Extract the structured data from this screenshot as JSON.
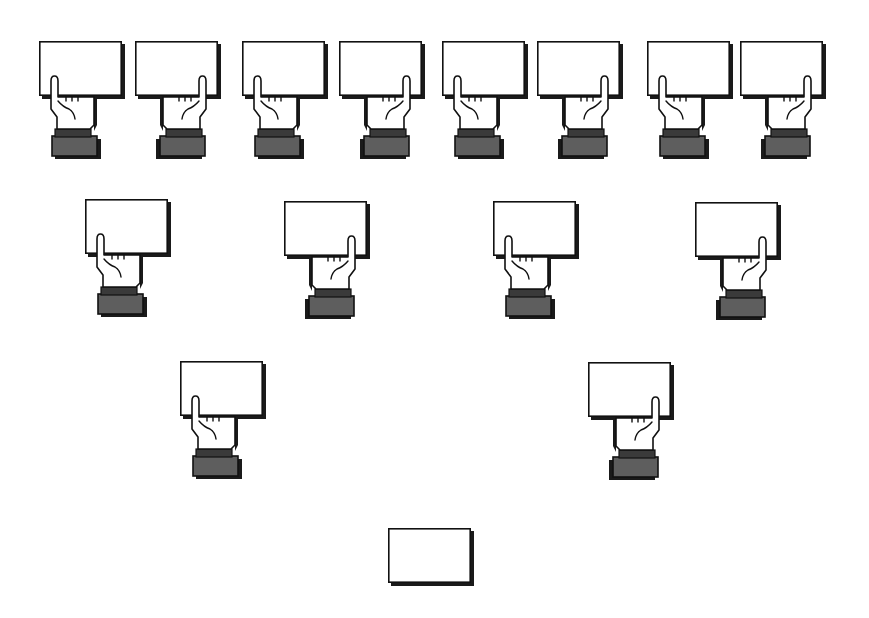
{
  "diagram": {
    "colors": {
      "background": "#ffffff",
      "card_fill": "#ffffff",
      "outline": "#111111",
      "cuff": "#5e5e5e",
      "shadow": "#1a1a1a"
    },
    "card_size": {
      "w": 83,
      "h": 55
    },
    "rows": [
      {
        "name": "row-1",
        "units": [
          {
            "x": 39,
            "y": 41,
            "thumb": "left",
            "hand": true
          },
          {
            "x": 135,
            "y": 41,
            "thumb": "right",
            "hand": true
          },
          {
            "x": 242,
            "y": 41,
            "thumb": "left",
            "hand": true
          },
          {
            "x": 339,
            "y": 41,
            "thumb": "right",
            "hand": true
          },
          {
            "x": 442,
            "y": 41,
            "thumb": "left",
            "hand": true
          },
          {
            "x": 537,
            "y": 41,
            "thumb": "right",
            "hand": true
          },
          {
            "x": 647,
            "y": 41,
            "thumb": "left",
            "hand": true
          },
          {
            "x": 740,
            "y": 41,
            "thumb": "right",
            "hand": true
          }
        ]
      },
      {
        "name": "row-2",
        "units": [
          {
            "x": 85,
            "y": 199,
            "thumb": "left",
            "hand": true
          },
          {
            "x": 284,
            "y": 201,
            "thumb": "right",
            "hand": true
          },
          {
            "x": 493,
            "y": 201,
            "thumb": "left",
            "hand": true
          },
          {
            "x": 695,
            "y": 202,
            "thumb": "right",
            "hand": true
          }
        ]
      },
      {
        "name": "row-3",
        "units": [
          {
            "x": 180,
            "y": 361,
            "thumb": "left",
            "hand": true
          },
          {
            "x": 588,
            "y": 362,
            "thumb": "right",
            "hand": true
          }
        ]
      },
      {
        "name": "row-4",
        "units": [
          {
            "x": 388,
            "y": 528,
            "thumb": "none",
            "hand": false
          }
        ]
      }
    ]
  }
}
